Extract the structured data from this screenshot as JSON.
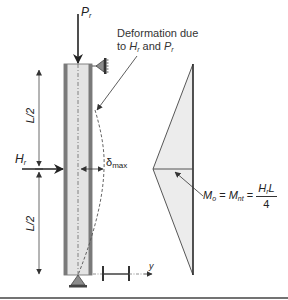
{
  "figure": {
    "type": "beam-column with lateral load and moment diagram",
    "colors": {
      "column_border": "#7a7a7a",
      "column_fill": "#e4e4e4",
      "moment_fill": "#ececec",
      "line": "#333333",
      "bottom_rule": "#444444"
    }
  },
  "labels": {
    "axial_load": {
      "symbol": "P",
      "subscript": "r"
    },
    "lateral_load": {
      "symbol": "H",
      "subscript": "r"
    },
    "half_length_top": "L/2",
    "half_length_bottom": "L/2",
    "deflection": {
      "symbol": "δ",
      "subscript": "max"
    },
    "deformation_note": {
      "line1": "Deformation due",
      "line2_prefix": "to ",
      "line2_H": "H",
      "line2_H_sub": "r",
      "line2_mid": " and ",
      "line2_P": "P",
      "line2_P_sub": "r"
    },
    "moment_equation": {
      "lhs": "M",
      "lhs_sub": "o",
      "eq1": " = ",
      "mid": "M",
      "mid_sub": "nt",
      "eq2": " = ",
      "numerator": "H",
      "numerator_sub": "r",
      "numerator_tail": "L",
      "denominator": "4"
    },
    "axis": "y"
  },
  "icons": {
    "top_support": "pin-support-icon",
    "bottom_support": "pin-support-icon",
    "section": "i-beam-section-icon"
  }
}
